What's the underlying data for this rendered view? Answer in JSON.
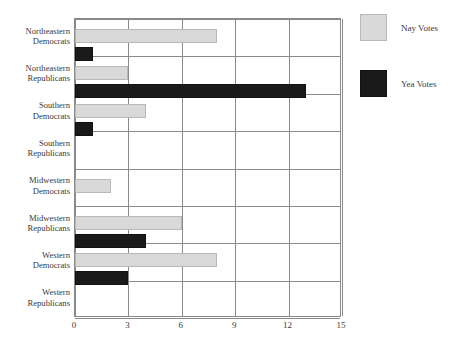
{
  "chart_data": {
    "type": "bar",
    "orientation": "horizontal",
    "title": "",
    "xlabel": "",
    "ylabel": "",
    "xlim": [
      0,
      15
    ],
    "xticks": [
      "0",
      "3",
      "6",
      "9",
      "12",
      "15"
    ],
    "grid": true,
    "legend_position": "right",
    "categories": [
      "Northeastern Democrats",
      "Northeastern Republicans",
      "Southern Democrats",
      "Southern Republicans",
      "Midwestern Democrats",
      "Midwestern Republicans",
      "Western Democrats",
      "Western Republicans"
    ],
    "category_lines": [
      [
        "Northeastern",
        "Democrats"
      ],
      [
        "Northeastern",
        "Republicans"
      ],
      [
        "Southern",
        "Democrats"
      ],
      [
        "Southern",
        "Republicans"
      ],
      [
        "Midwestern",
        "Democrats"
      ],
      [
        "Midwestern",
        "Republicans"
      ],
      [
        "Western",
        "Democrats"
      ],
      [
        "Western",
        "Republicans"
      ]
    ],
    "series": [
      {
        "name": "Nay Votes",
        "color": "#d9d9d9",
        "values": [
          8,
          3,
          4,
          0,
          2,
          6,
          8,
          0
        ]
      },
      {
        "name": "Yea Votes",
        "color": "#1a1a1a",
        "values": [
          1,
          13,
          1,
          0,
          0,
          4,
          3,
          0
        ]
      }
    ]
  },
  "legend": {
    "items": [
      {
        "label": "Nay Votes",
        "swatch": "nay-swatch"
      },
      {
        "label": "Yea Votes",
        "swatch": "yea-swatch"
      }
    ]
  }
}
